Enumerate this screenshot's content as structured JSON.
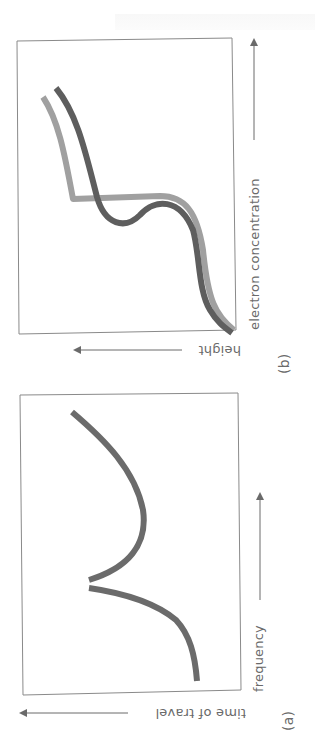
{
  "figure": {
    "orientation": "rotated 90 degrees counter-clockwise",
    "panels": [
      {
        "id": "a",
        "panel_label": "(a)",
        "x_axis_label": "frequency",
        "y_axis_label": "time of travel",
        "curves": [
          {
            "name": "travel-time-curve",
            "color": "#6b6b6b",
            "description": "time of travel rises with frequency to a cusp, drops, then rises again"
          }
        ]
      },
      {
        "id": "b",
        "panel_label": "(b)",
        "x_axis_label": "electron concentration",
        "y_axis_label": "height",
        "curves": [
          {
            "name": "profile-dark",
            "color": "#5e5e5e",
            "description": "smooth profile with a valley"
          },
          {
            "name": "profile-light",
            "color": "#9a9a9a",
            "description": "monotonic profile with a plateau"
          }
        ]
      }
    ]
  }
}
